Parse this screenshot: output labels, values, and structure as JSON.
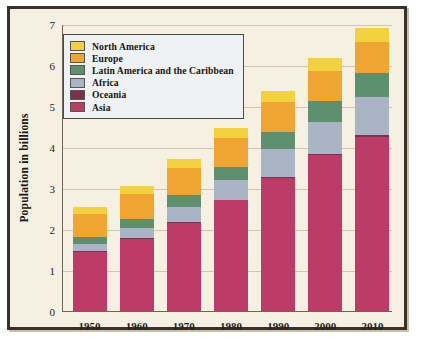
{
  "chart_data": {
    "type": "bar",
    "stacked": true,
    "title": "",
    "xlabel": "",
    "ylabel": "Population in billions",
    "ylim": [
      0,
      7
    ],
    "yticks": [
      "0",
      "1",
      "2",
      "3",
      "4",
      "5",
      "6",
      "7"
    ],
    "grid": true,
    "legend_position": "upper-left",
    "categories": [
      "1950",
      "1960",
      "1970",
      "1980",
      "1990",
      "2000",
      "2010"
    ],
    "series": [
      {
        "name": "Asia",
        "color": "#bd3b67",
        "values": [
          1.45,
          1.75,
          2.15,
          2.7,
          3.25,
          3.8,
          4.25
        ]
      },
      {
        "name": "Oceania",
        "color": "#7c3152",
        "values": [
          0.01,
          0.02,
          0.02,
          0.02,
          0.03,
          0.03,
          0.04
        ]
      },
      {
        "name": "Africa",
        "color": "#a9b5c4",
        "values": [
          0.18,
          0.25,
          0.37,
          0.48,
          0.67,
          0.78,
          0.93
        ]
      },
      {
        "name": "Latin America and the Caribbean",
        "color": "#5e8f6e",
        "values": [
          0.17,
          0.23,
          0.28,
          0.32,
          0.42,
          0.51,
          0.59
        ]
      },
      {
        "name": "Europe",
        "color": "#f0a431",
        "values": [
          0.55,
          0.6,
          0.66,
          0.69,
          0.72,
          0.73,
          0.74
        ]
      },
      {
        "name": "North America",
        "color": "#f2d33e",
        "values": [
          0.17,
          0.2,
          0.24,
          0.26,
          0.28,
          0.31,
          0.35
        ]
      }
    ],
    "totals": [
      2.44,
      3.03,
      3.72,
      4.5,
      5.35,
      6.15,
      6.95
    ]
  },
  "legend": {
    "entries": [
      {
        "label": "North America",
        "color": "#f2d33e"
      },
      {
        "label": "Europe",
        "color": "#f0a431"
      },
      {
        "label": "Latin America and the Caribbean",
        "color": "#5e8f6e"
      },
      {
        "label": "Africa",
        "color": "#a9b5c4"
      },
      {
        "label": "Oceania",
        "color": "#7c3152"
      },
      {
        "label": "Asia",
        "color": "#bd3b67"
      }
    ]
  },
  "style": {
    "background": "#f6f0e2",
    "frame_color": "#3a3228",
    "grid_color": "#cfc6b0",
    "axis_color": "#6e6654",
    "legend_background": "#eef2f5"
  }
}
